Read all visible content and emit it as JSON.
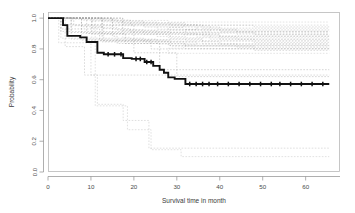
{
  "chart_data": {
    "type": "line",
    "title": "",
    "xlabel": "Survival time in month",
    "ylabel": "Probability",
    "xlim": [
      0,
      68
    ],
    "ylim": [
      0.0,
      1.04
    ],
    "xticks": [
      0,
      10,
      20,
      30,
      40,
      50,
      60
    ],
    "xticklabels": [
      "0",
      "10",
      "20",
      "30",
      "40",
      "50",
      "60"
    ],
    "yticks": [
      0.0,
      0.2,
      0.4,
      0.6,
      0.8,
      1.0
    ],
    "yticklabels": [
      "0.0",
      "0.2",
      "0.4",
      "0.6",
      "0.8",
      "1.0"
    ],
    "grid": false,
    "legend": "none",
    "style": "kaplan-meier step",
    "series": [
      {
        "name": "overall-survival",
        "emphasis": "bold-solid-black",
        "color": "#111111",
        "x": [
          0,
          2,
          3.5,
          3.5,
          4.5,
          4.5,
          7.5,
          7.5,
          9,
          9,
          11.5,
          11.5,
          13,
          13,
          17.5,
          17.5,
          19.5,
          19.5,
          22.5,
          22.5,
          24.5,
          24.5,
          26,
          26,
          27,
          27,
          28,
          28,
          29.5,
          29.5,
          32,
          32,
          65.5
        ],
        "y": [
          1.0,
          1.0,
          1.0,
          0.955,
          0.955,
          0.885,
          0.885,
          0.875,
          0.875,
          0.845,
          0.845,
          0.775,
          0.775,
          0.765,
          0.765,
          0.74,
          0.74,
          0.735,
          0.735,
          0.715,
          0.715,
          0.69,
          0.69,
          0.665,
          0.665,
          0.645,
          0.645,
          0.615,
          0.615,
          0.605,
          0.605,
          0.572,
          0.572
        ],
        "censor_x": [
          14,
          15.5,
          17,
          20.5,
          21.5,
          23,
          24,
          33,
          34.5,
          36,
          37.5,
          39.5,
          42,
          44.5,
          47,
          49.5,
          52,
          54,
          56.5,
          59,
          61.5,
          64
        ],
        "censor_y": [
          0.765,
          0.765,
          0.765,
          0.735,
          0.735,
          0.715,
          0.715,
          0.572,
          0.572,
          0.572,
          0.572,
          0.572,
          0.572,
          0.572,
          0.572,
          0.572,
          0.572,
          0.572,
          0.572,
          0.572,
          0.572,
          0.572
        ]
      },
      {
        "name": "subgroup-band-upper",
        "emphasis": "faint-dashed-gray",
        "color": "#a8a8a8",
        "note": "dense cluster of subgroup curves between 0.85 and 1.00"
      },
      {
        "name": "subgroup-mid-1",
        "emphasis": "faint-dashed-gray",
        "color": "#b0b0b0",
        "x": [
          0,
          3,
          3,
          12,
          12,
          24,
          24,
          65.5
        ],
        "y": [
          1.0,
          1.0,
          0.93,
          0.93,
          0.855,
          0.855,
          0.8,
          0.8
        ]
      },
      {
        "name": "subgroup-mid-2",
        "emphasis": "faint-dashed-gray",
        "color": "#b0b0b0",
        "x": [
          0,
          9,
          9,
          18,
          18,
          26,
          26,
          65.5
        ],
        "y": [
          1.0,
          1.0,
          0.9,
          0.9,
          0.835,
          0.835,
          0.665,
          0.665
        ]
      },
      {
        "name": "subgroup-mid-3",
        "emphasis": "faint-dashed-gray",
        "color": "#b4b4b4",
        "x": [
          0,
          6,
          6,
          20,
          20,
          30,
          30,
          65.5
        ],
        "y": [
          1.0,
          1.0,
          0.955,
          0.955,
          0.775,
          0.775,
          0.62,
          0.62
        ]
      },
      {
        "name": "subgroup-low-1",
        "emphasis": "faint-dashed-gray",
        "color": "#bdbdbd",
        "x": [
          0,
          4,
          4,
          8.5,
          8.5,
          65.5
        ],
        "y": [
          1.0,
          1.0,
          0.815,
          0.815,
          0.63,
          0.63
        ]
      },
      {
        "name": "subgroup-low-2",
        "emphasis": "faint-dashed-gray",
        "color": "#c4c4c4",
        "x": [
          0,
          2.5,
          2.5,
          10,
          10,
          11.5,
          11.5,
          17.5,
          17.5,
          23.5,
          23.5,
          65.5
        ],
        "y": [
          1.0,
          1.0,
          0.84,
          0.84,
          0.63,
          0.63,
          0.44,
          0.44,
          0.335,
          0.335,
          0.155,
          0.155
        ]
      },
      {
        "name": "subgroup-low-3",
        "emphasis": "faint-dashed-gray",
        "color": "#c8c8c8",
        "x": [
          0,
          11,
          11,
          18.5,
          18.5,
          24,
          24,
          31,
          31,
          65.5
        ],
        "y": [
          1.0,
          1.0,
          0.43,
          0.43,
          0.275,
          0.275,
          0.145,
          0.145,
          0.1,
          0.1
        ]
      }
    ]
  },
  "axes": {
    "xlabel": "Survival time in month",
    "ylabel": "Probability"
  }
}
